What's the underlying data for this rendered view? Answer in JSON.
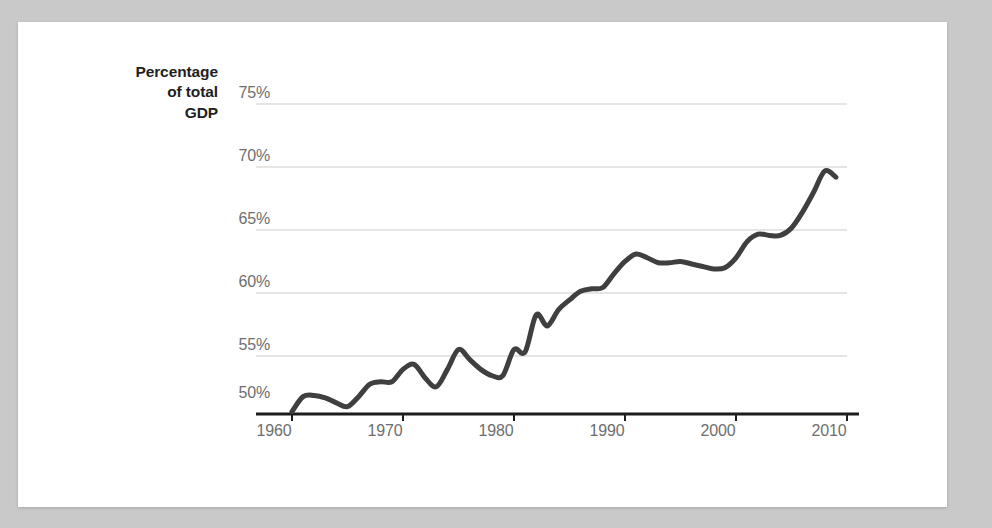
{
  "page": {
    "background_color": "#c9c9c9",
    "card_background": "#ffffff"
  },
  "chart_data": {
    "type": "line",
    "title": "",
    "subtitle": "",
    "xlabel": "",
    "ylabel": "Percentage of total GDP",
    "ylabel_lines": [
      "Percentage",
      "of total",
      "GDP"
    ],
    "xlim": [
      1958.5,
      2012.5
    ],
    "ylim": [
      50,
      76.5
    ],
    "yticks": [
      50,
      55,
      60,
      65,
      70,
      75
    ],
    "ytick_labels": [
      "50%",
      "55%",
      "60%",
      "65%",
      "70%",
      "75%"
    ],
    "xticks": [
      1960,
      1970,
      1980,
      1990,
      2000,
      2010
    ],
    "xtick_labels": [
      "1960",
      "1970",
      "1980",
      "1990",
      "2000",
      "2010"
    ],
    "grid": true,
    "grid_color": "#dcdcdc",
    "axis_color": "#222222",
    "line_color": "#3f3f3f",
    "line_width": 5,
    "legend": "none",
    "series": [
      {
        "name": "Percentage of total GDP",
        "x": [
          1960,
          1961,
          1962,
          1963,
          1964,
          1965,
          1966,
          1967,
          1968,
          1969,
          1970,
          1971,
          1972,
          1973,
          1974,
          1975,
          1976,
          1977,
          1978,
          1979,
          1980,
          1981,
          1982,
          1983,
          1984,
          1985,
          1986,
          1987,
          1988,
          1989,
          1990,
          1991,
          1992,
          1993,
          1994,
          1995,
          1996,
          1997,
          1998,
          1999,
          2000,
          2001,
          2002,
          2003,
          2004,
          2005,
          2006,
          2007,
          2008,
          2009
        ],
        "values": [
          50.2,
          51.4,
          51.5,
          51.3,
          50.9,
          50.6,
          51.4,
          52.4,
          52.6,
          52.6,
          53.6,
          54.0,
          52.9,
          52.2,
          53.6,
          55.2,
          54.4,
          53.6,
          53.1,
          53.1,
          55.2,
          55.0,
          58.0,
          57.1,
          58.4,
          59.2,
          59.9,
          60.1,
          60.2,
          61.3,
          62.3,
          62.9,
          62.6,
          62.2,
          62.2,
          62.3,
          62.1,
          61.9,
          61.7,
          61.8,
          62.6,
          63.9,
          64.5,
          64.4,
          64.4,
          65.0,
          66.3,
          67.9,
          69.6,
          69.1
        ]
      }
    ]
  }
}
